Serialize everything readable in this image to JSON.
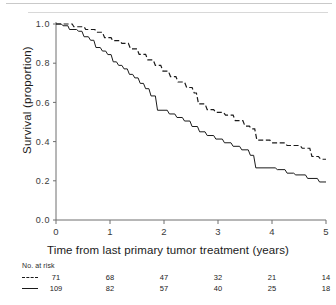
{
  "chart_data": {
    "type": "line",
    "title": "",
    "xlabel": "Time from last primary tumor treatment (years)",
    "ylabel": "Survival (proportion)",
    "xlim": [
      0,
      5
    ],
    "ylim": [
      0,
      1
    ],
    "xticks": [
      "0",
      "1",
      "2",
      "3",
      "4",
      "5"
    ],
    "yticks": [
      "0.0",
      "0.2",
      "0.4",
      "0.6",
      "0.8",
      "1.0"
    ],
    "grid": false,
    "legend_position": "none",
    "series": [
      {
        "name": "dashed-group",
        "style": "dashed",
        "color": "#1a1a1a",
        "points": [
          [
            0.0,
            1.0
          ],
          [
            0.3,
            1.0
          ],
          [
            0.33,
            0.986
          ],
          [
            0.52,
            0.986
          ],
          [
            0.55,
            0.972
          ],
          [
            0.72,
            0.972
          ],
          [
            0.75,
            0.958
          ],
          [
            0.86,
            0.958
          ],
          [
            0.9,
            0.93
          ],
          [
            1.02,
            0.93
          ],
          [
            1.05,
            0.915
          ],
          [
            1.18,
            0.915
          ],
          [
            1.22,
            0.901
          ],
          [
            1.34,
            0.901
          ],
          [
            1.38,
            0.873
          ],
          [
            1.5,
            0.873
          ],
          [
            1.54,
            0.845
          ],
          [
            1.66,
            0.845
          ],
          [
            1.7,
            0.817
          ],
          [
            1.8,
            0.817
          ],
          [
            1.84,
            0.789
          ],
          [
            1.94,
            0.789
          ],
          [
            1.98,
            0.76
          ],
          [
            2.08,
            0.76
          ],
          [
            2.12,
            0.732
          ],
          [
            2.22,
            0.732
          ],
          [
            2.26,
            0.704
          ],
          [
            2.38,
            0.704
          ],
          [
            2.42,
            0.676
          ],
          [
            2.52,
            0.676
          ],
          [
            2.56,
            0.648
          ],
          [
            2.6,
            0.648
          ],
          [
            2.64,
            0.592
          ],
          [
            2.76,
            0.592
          ],
          [
            2.8,
            0.563
          ],
          [
            2.92,
            0.563
          ],
          [
            2.96,
            0.549
          ],
          [
            3.1,
            0.549
          ],
          [
            3.14,
            0.535
          ],
          [
            3.28,
            0.535
          ],
          [
            3.32,
            0.507
          ],
          [
            3.46,
            0.507
          ],
          [
            3.5,
            0.479
          ],
          [
            3.58,
            0.479
          ],
          [
            3.62,
            0.465
          ],
          [
            3.68,
            0.465
          ],
          [
            3.72,
            0.408
          ],
          [
            3.96,
            0.408
          ],
          [
            4.0,
            0.394
          ],
          [
            4.24,
            0.394
          ],
          [
            4.28,
            0.38
          ],
          [
            4.52,
            0.38
          ],
          [
            4.56,
            0.366
          ],
          [
            4.7,
            0.366
          ],
          [
            4.74,
            0.324
          ],
          [
            4.86,
            0.324
          ],
          [
            4.9,
            0.31
          ],
          [
            5.0,
            0.31
          ]
        ]
      },
      {
        "name": "solid-group",
        "style": "solid",
        "color": "#1a1a1a",
        "points": [
          [
            0.0,
            1.0
          ],
          [
            0.1,
            1.0
          ],
          [
            0.13,
            0.991
          ],
          [
            0.22,
            0.991
          ],
          [
            0.25,
            0.972
          ],
          [
            0.38,
            0.972
          ],
          [
            0.42,
            0.963
          ],
          [
            0.48,
            0.963
          ],
          [
            0.52,
            0.935
          ],
          [
            0.6,
            0.935
          ],
          [
            0.64,
            0.917
          ],
          [
            0.7,
            0.917
          ],
          [
            0.74,
            0.88
          ],
          [
            0.82,
            0.88
          ],
          [
            0.86,
            0.862
          ],
          [
            0.92,
            0.862
          ],
          [
            0.96,
            0.844
          ],
          [
            1.02,
            0.844
          ],
          [
            1.06,
            0.807
          ],
          [
            1.12,
            0.807
          ],
          [
            1.16,
            0.789
          ],
          [
            1.22,
            0.789
          ],
          [
            1.26,
            0.771
          ],
          [
            1.32,
            0.771
          ],
          [
            1.36,
            0.743
          ],
          [
            1.42,
            0.743
          ],
          [
            1.46,
            0.725
          ],
          [
            1.52,
            0.725
          ],
          [
            1.56,
            0.697
          ],
          [
            1.62,
            0.697
          ],
          [
            1.66,
            0.67
          ],
          [
            1.72,
            0.67
          ],
          [
            1.76,
            0.633
          ],
          [
            1.84,
            0.633
          ],
          [
            1.88,
            0.56
          ],
          [
            2.06,
            0.56
          ],
          [
            2.1,
            0.541
          ],
          [
            2.2,
            0.541
          ],
          [
            2.24,
            0.523
          ],
          [
            2.34,
            0.523
          ],
          [
            2.38,
            0.505
          ],
          [
            2.48,
            0.505
          ],
          [
            2.52,
            0.477
          ],
          [
            2.62,
            0.477
          ],
          [
            2.66,
            0.45
          ],
          [
            2.76,
            0.45
          ],
          [
            2.8,
            0.431
          ],
          [
            2.92,
            0.431
          ],
          [
            2.96,
            0.413
          ],
          [
            3.08,
            0.413
          ],
          [
            3.12,
            0.394
          ],
          [
            3.24,
            0.394
          ],
          [
            3.28,
            0.376
          ],
          [
            3.4,
            0.376
          ],
          [
            3.44,
            0.358
          ],
          [
            3.56,
            0.358
          ],
          [
            3.6,
            0.33
          ],
          [
            3.66,
            0.33
          ],
          [
            3.7,
            0.266
          ],
          [
            4.06,
            0.266
          ],
          [
            4.1,
            0.257
          ],
          [
            4.24,
            0.257
          ],
          [
            4.28,
            0.239
          ],
          [
            4.4,
            0.239
          ],
          [
            4.44,
            0.23
          ],
          [
            4.62,
            0.23
          ],
          [
            4.66,
            0.212
          ],
          [
            4.84,
            0.212
          ],
          [
            4.88,
            0.194
          ],
          [
            5.0,
            0.194
          ]
        ]
      }
    ]
  },
  "risk_table": {
    "title": "No. at risk",
    "times": [
      "0",
      "1",
      "2",
      "3",
      "4",
      "5"
    ],
    "rows": [
      {
        "key": "dashed",
        "values": [
          "71",
          "68",
          "47",
          "32",
          "21",
          "14"
        ]
      },
      {
        "key": "solid",
        "values": [
          "109",
          "82",
          "57",
          "40",
          "25",
          "18"
        ]
      }
    ]
  }
}
